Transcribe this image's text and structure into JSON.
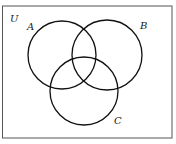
{
  "diagram": {
    "type": "venn",
    "universe": {
      "label": "U",
      "rect": {
        "x": 2.5,
        "y": 6,
        "width": 169.5,
        "height": 132
      },
      "stroke": "#555555",
      "label_pos": {
        "x": 10,
        "y": 22
      }
    },
    "sets": [
      {
        "id": "A",
        "label": "A",
        "cx": 62,
        "cy": 55,
        "r": 34,
        "label_pos": {
          "x": 27,
          "y": 30
        }
      },
      {
        "id": "B",
        "label": "B",
        "cx": 107,
        "cy": 55,
        "r": 35,
        "label_pos": {
          "x": 140,
          "y": 29
        }
      },
      {
        "id": "C",
        "label": "C",
        "cx": 84,
        "cy": 91,
        "r": 34,
        "label_pos": {
          "x": 114,
          "y": 124
        }
      }
    ],
    "stroke_color": "#111111",
    "stroke_width": 1.3
  }
}
